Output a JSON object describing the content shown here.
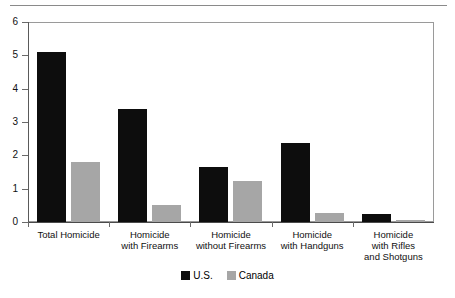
{
  "chart_data": {
    "type": "bar",
    "title": "",
    "subtitle": "",
    "xlabel": "",
    "ylabel": "",
    "ylim": [
      0,
      6
    ],
    "yticks": [
      0,
      1,
      2,
      3,
      4,
      5,
      6
    ],
    "ytick_labels": [
      "0",
      "1",
      "2",
      "3",
      "4",
      "5",
      "6"
    ],
    "grid": false,
    "legend_position": "bottom-center",
    "categories": [
      "Total Homicide",
      "Homicide\nwith Firearms",
      "Homicide\nwithout Firearms",
      "Homicide\nwith Handguns",
      "Homicide\nwith Rifles\nand Shotguns"
    ],
    "series": [
      {
        "name": "U.S.",
        "color": "#0d0d0d",
        "values": [
          5.1,
          3.4,
          1.65,
          2.37,
          0.23
        ]
      },
      {
        "name": "Canada",
        "color": "#a6a6a6",
        "values": [
          1.8,
          0.5,
          1.22,
          0.28,
          0.05
        ]
      }
    ]
  },
  "axis": {
    "y_tick_labels": [
      "6",
      "5",
      "4",
      "3",
      "2",
      "1",
      "0"
    ]
  },
  "categories_display": [
    {
      "line1": "Total Homicide",
      "line2": "",
      "line3": ""
    },
    {
      "line1": "Homicide",
      "line2": "with Firearms",
      "line3": ""
    },
    {
      "line1": "Homicide",
      "line2": "without Firearms",
      "line3": ""
    },
    {
      "line1": "Homicide",
      "line2": "with Handguns",
      "line3": ""
    },
    {
      "line1": "Homicide",
      "line2": "with Rifles",
      "line3": "and Shotguns"
    }
  ],
  "legend": {
    "items": [
      {
        "label": "U.S.",
        "color": "#0d0d0d"
      },
      {
        "label": "Canada",
        "color": "#a6a6a6"
      }
    ]
  }
}
